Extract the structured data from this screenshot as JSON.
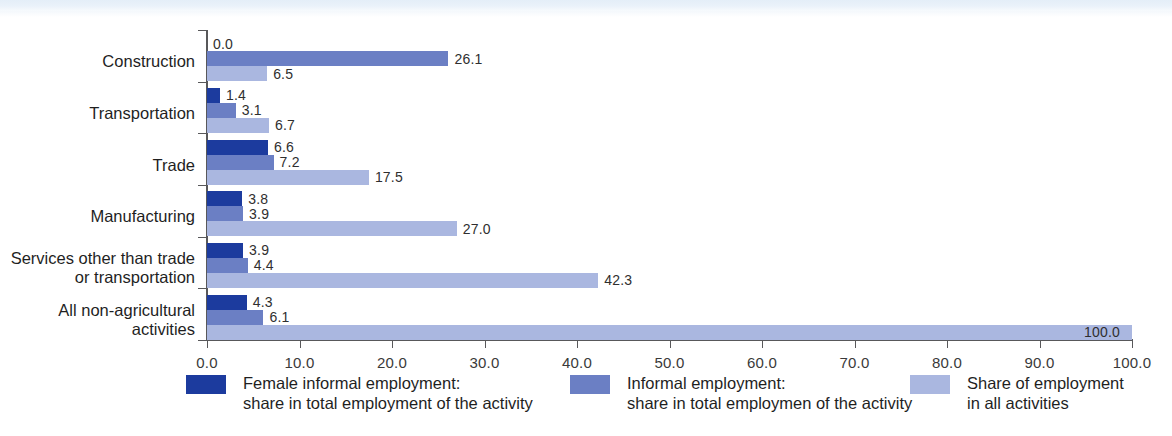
{
  "chart_data": {
    "type": "bar",
    "orientation": "horizontal",
    "title": "",
    "xlabel": "",
    "ylabel": "",
    "xlim": [
      0.0,
      100.0
    ],
    "xtick_step": 10.0,
    "grid": false,
    "legend_position": "bottom",
    "xticks": [
      "0.0",
      "10.0",
      "20.0",
      "30.0",
      "40.0",
      "50.0",
      "60.0",
      "70.0",
      "80.0",
      "90.0",
      "100.0"
    ],
    "categories": [
      "Construction",
      "Transportation",
      "Trade",
      "Manufacturing",
      "Services other than trade\nor transportation",
      "All non-agricultural\nactivities"
    ],
    "series": [
      {
        "name": "Female informal employment:\nshare in total employment of the activity",
        "color": "#1c3b9e",
        "values": [
          0.0,
          1.4,
          6.6,
          3.8,
          3.9,
          4.3
        ],
        "labels": [
          "0.0",
          "1.4",
          "6.6",
          "3.8",
          "3.9",
          "4.3"
        ]
      },
      {
        "name": "Informal employment:\nshare in total employmen of the activity",
        "color": "#6b7fc4",
        "values": [
          26.1,
          3.1,
          7.2,
          3.9,
          4.4,
          6.1
        ],
        "labels": [
          "26.1",
          "3.1",
          "7.2",
          "3.9",
          "4.4",
          "6.1"
        ]
      },
      {
        "name": "Share of employment\nin all activities",
        "color": "#aab7e0",
        "values": [
          6.5,
          6.7,
          17.5,
          27.0,
          42.3,
          100.0
        ],
        "labels": [
          "6.5",
          "6.7",
          "17.5",
          "27.0",
          "42.3",
          "100.0"
        ]
      }
    ]
  },
  "legend": {
    "items": [
      {
        "swatch": "s0",
        "label": "Female informal employment:\nshare in total employment of the activity"
      },
      {
        "swatch": "s1",
        "label": "Informal employment:\nshare in total employmen of the activity"
      },
      {
        "swatch": "s2",
        "label": "Share of employment\nin all activities"
      }
    ]
  },
  "colors": {
    "series_dark": "#1c3b9e",
    "series_medium": "#6b7fc4",
    "series_light": "#aab7e0",
    "axis": "#58585a",
    "text": "#1f1f1f",
    "background": "#ffffff"
  }
}
